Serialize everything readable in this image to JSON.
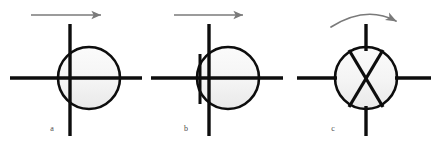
{
  "figure": {
    "background_color": "#ffffff",
    "stroke_color": "#0d0d0d",
    "arrow_color": "#7a7a7a",
    "circle_fill": "#f4f4f4",
    "circle_fill_bottom": "#ededed",
    "label_color": "#4a4a4a",
    "width": 437,
    "height": 147
  },
  "panels": [
    {
      "id": "a",
      "label": "a",
      "label_x": 52,
      "label_y": 131,
      "circle": {
        "cx": 89,
        "cy": 78,
        "r": 31
      },
      "horizontal_line": {
        "x1": 10,
        "y1": 78,
        "x2": 142,
        "y2": 78
      },
      "vertical_line": {
        "x1": 70,
        "y1": 24,
        "x2": 70,
        "y2": 136
      },
      "arrow": {
        "type": "straight",
        "direction": "right",
        "x1": 31,
        "y1": 15,
        "x2": 104,
        "y2": 15
      },
      "chord": null
    },
    {
      "id": "b",
      "label": "b",
      "label_x": 186,
      "label_y": 131,
      "circle": {
        "cx": 228,
        "cy": 78,
        "r": 31
      },
      "horizontal_line": {
        "x1": 151,
        "y1": 78,
        "x2": 283,
        "y2": 78
      },
      "vertical_line": {
        "x1": 209,
        "y1": 24,
        "x2": 209,
        "y2": 136
      },
      "arrow": {
        "type": "straight",
        "direction": "right",
        "x1": 174,
        "y1": 15,
        "x2": 246,
        "y2": 15
      },
      "chord": {
        "x1": 200,
        "y1": 54,
        "x2": 200,
        "y2": 104
      }
    },
    {
      "id": "c",
      "label": "c",
      "label_x": 333,
      "label_y": 131,
      "circle": {
        "cx": 366,
        "cy": 78,
        "r": 31
      },
      "horizontal_line_left": {
        "x1": 297,
        "y1": 78,
        "x2": 336,
        "y2": 78
      },
      "horizontal_line_right": {
        "x1": 396,
        "y1": 78,
        "x2": 431,
        "y2": 78
      },
      "vertical_stub_top": {
        "x1": 366,
        "y1": 24,
        "x2": 366,
        "y2": 50
      },
      "vertical_stub_bottom": {
        "x1": 366,
        "y1": 107,
        "x2": 366,
        "y2": 136
      },
      "cross": {
        "leg_1": {
          "x1": 349,
          "y1": 50,
          "x2": 383,
          "y2": 107
        },
        "leg_2": {
          "x1": 383,
          "y1": 50,
          "x2": 349,
          "y2": 107
        }
      },
      "arrow": {
        "type": "curved",
        "direction": "clockwise",
        "path": "M 331 26 Q 366 6 398 22",
        "head_x": 398,
        "head_y": 22
      }
    }
  ]
}
